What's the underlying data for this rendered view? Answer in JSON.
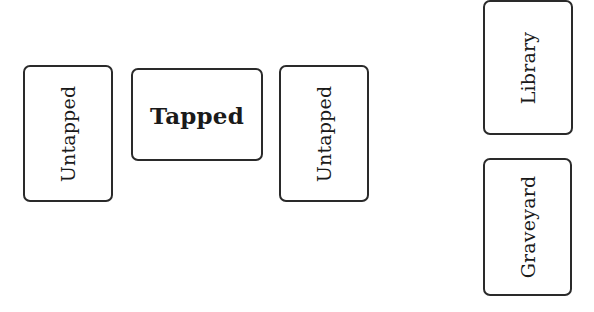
{
  "battlefield": {
    "cards": [
      {
        "label": "Untapped",
        "state": "untapped"
      },
      {
        "label": "Tapped",
        "state": "tapped"
      },
      {
        "label": "Untapped",
        "state": "untapped"
      }
    ]
  },
  "zones": {
    "library": {
      "label": "Library"
    },
    "graveyard": {
      "label": "Graveyard"
    }
  },
  "colors": {
    "card_border": "#2a2a2a",
    "card_background": "#ffffff",
    "text": "#1a1a1a"
  }
}
